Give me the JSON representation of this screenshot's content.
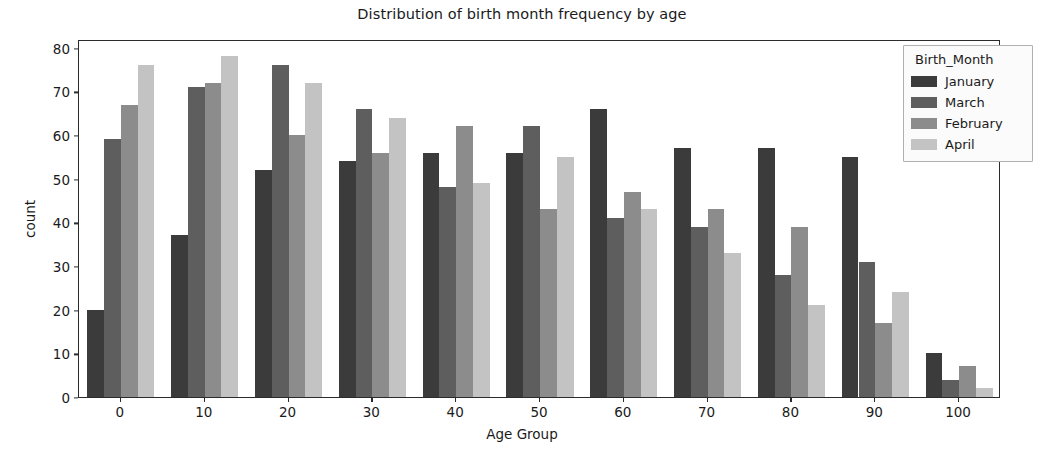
{
  "chart_data": {
    "type": "bar",
    "title": "Distribution of birth month frequency by age",
    "xlabel": "Age Group",
    "ylabel": "count",
    "categories": [
      "0",
      "10",
      "20",
      "30",
      "40",
      "50",
      "60",
      "70",
      "80",
      "90",
      "100"
    ],
    "series": [
      {
        "name": "January",
        "color": "#3b3b3b",
        "values": [
          20,
          37,
          52,
          54,
          56,
          56,
          66,
          57,
          57,
          55,
          10
        ]
      },
      {
        "name": "March",
        "color": "#5e5e5e",
        "values": [
          59,
          71,
          76,
          66,
          48,
          62,
          41,
          39,
          28,
          31,
          4
        ]
      },
      {
        "name": "February",
        "color": "#8c8c8c",
        "values": [
          67,
          72,
          60,
          56,
          62,
          43,
          47,
          43,
          39,
          17,
          7
        ]
      },
      {
        "name": "April",
        "color": "#c3c3c3",
        "values": [
          76,
          78,
          72,
          64,
          49,
          55,
          43,
          33,
          21,
          24,
          2
        ]
      }
    ],
    "ylim": [
      0,
      82
    ],
    "yticks": [
      0,
      10,
      20,
      30,
      40,
      50,
      60,
      70,
      80
    ],
    "xticks": [
      0,
      10,
      20,
      30,
      40,
      50,
      60,
      70,
      80,
      90,
      100
    ],
    "grid": false,
    "legend": {
      "title": "Birth_Month",
      "position": "upper right",
      "entries": [
        "January",
        "March",
        "February",
        "April"
      ]
    }
  }
}
